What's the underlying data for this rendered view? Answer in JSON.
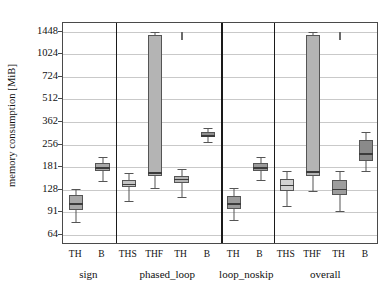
{
  "chart_data": {
    "type": "boxplot",
    "title": "",
    "xlabel": "",
    "ylabel": "memory consumption [MiB]",
    "yscale": "log2-sqrt",
    "ylim": [
      55,
      1650
    ],
    "grid": true,
    "legend": "none",
    "ytick_labels": [
      "1448",
      "1024",
      "724",
      "512",
      "362",
      "256",
      "181",
      "128",
      "91",
      "64"
    ],
    "ytick_values": [
      1448,
      1024,
      724,
      512,
      362,
      256,
      181,
      128,
      91,
      64
    ],
    "groups": [
      {
        "name": "sign",
        "boxes": [
          {
            "label": "TH",
            "whisker_low": 78,
            "q1": 94,
            "median": 104,
            "q3": 119,
            "whisker_high": 129,
            "fill": "#a8a8a8"
          },
          {
            "label": "B",
            "whisker_low": 146,
            "q1": 172,
            "median": 181,
            "q3": 192,
            "whisker_high": 213,
            "fill": "#a8a8a8"
          }
        ]
      },
      {
        "name": "phased_loop",
        "boxes": [
          {
            "label": "THS",
            "whisker_low": 108,
            "q1": 133,
            "median": 141,
            "q3": 150,
            "whisker_high": 166,
            "fill": "#c3c3c3"
          },
          {
            "label": "THF",
            "whisker_low": 131,
            "q1": 159,
            "median": 168,
            "q3": 1380,
            "whisker_high": 1448,
            "fill": "#b4b4b4"
          },
          {
            "label": "TH",
            "whisker_low": 114,
            "q1": 143,
            "median": 151,
            "q3": 159,
            "whisker_high": 176,
            "fill": "#b4b4b4"
          },
          {
            "label": "B",
            "whisker_low": 268,
            "q1": 286,
            "median": 296,
            "q3": 309,
            "whisker_high": 330,
            "fill": "#8f8f8f"
          }
        ]
      },
      {
        "name": "loop_noskip",
        "boxes": [
          {
            "label": "TH",
            "whisker_low": 81,
            "q1": 96,
            "median": 104,
            "q3": 116,
            "whisker_high": 131,
            "fill": "#9a9a9a"
          },
          {
            "label": "B",
            "whisker_low": 150,
            "q1": 172,
            "median": 181,
            "q3": 192,
            "whisker_high": 212,
            "fill": "#9a9a9a"
          }
        ]
      },
      {
        "name": "overall",
        "boxes": [
          {
            "label": "THS",
            "whisker_low": 100,
            "q1": 126,
            "median": 138,
            "q3": 151,
            "whisker_high": 172,
            "fill": "#d2d2d2"
          },
          {
            "label": "THF",
            "whisker_low": 126,
            "q1": 158,
            "median": 170,
            "q3": 1375,
            "whisker_high": 1448,
            "fill": "#b4b4b4"
          },
          {
            "label": "TH",
            "whisker_low": 92,
            "q1": 118,
            "median": 130,
            "q3": 150,
            "whisker_high": 172,
            "fill": "#9d9d9d"
          },
          {
            "label": "B",
            "whisker_low": 172,
            "q1": 200,
            "median": 224,
            "q3": 276,
            "whisker_high": 312,
            "fill": "#8a8a8a"
          }
        ]
      }
    ],
    "outlier_marks": [
      {
        "group": "phased_loop",
        "after_label": "THF",
        "low": 1280,
        "high": 1448
      },
      {
        "group": "overall",
        "after_label": "THF",
        "low": 1280,
        "high": 1448
      }
    ]
  }
}
